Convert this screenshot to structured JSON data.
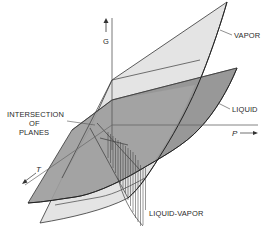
{
  "diagram": {
    "title": "",
    "axes": {
      "g_label": "G",
      "p_label": "P",
      "t_label": "T"
    },
    "surfaces": [
      {
        "name": "vapor",
        "label": "VAPOR",
        "fill": "#e3e3e3"
      },
      {
        "name": "liquid",
        "label": "LIQUID",
        "fill": "#9c9c9c"
      }
    ],
    "annotations": {
      "intersection_line1": "INTERSECTION",
      "intersection_line2": "OF",
      "intersection_line3": "PLANES",
      "liquid_vapor": "LIQUID-VAPOR"
    },
    "colors": {
      "line": "#2b2b2b",
      "vapor_fill": "#e3e3e3",
      "liquid_fill": "#9c9c9c",
      "overlap_fill": "#8a8a8a",
      "axis": "#555555"
    }
  }
}
